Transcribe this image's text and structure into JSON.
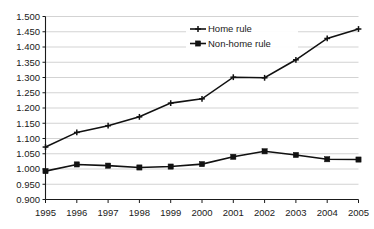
{
  "chart_data": {
    "type": "line",
    "title": "",
    "subtitle": "",
    "xlabel": "",
    "ylabel": "",
    "categories": [
      "1995",
      "1996",
      "1997",
      "1998",
      "1999",
      "2000",
      "2001",
      "2002",
      "2003",
      "2004",
      "2005"
    ],
    "x": [
      1995,
      1996,
      1997,
      1998,
      1999,
      2000,
      2001,
      2002,
      2003,
      2004,
      2005
    ],
    "series": [
      {
        "name": "Home rule",
        "marker": "cross",
        "color": "#111111",
        "values": [
          1.072,
          1.12,
          1.142,
          1.171,
          1.216,
          1.23,
          1.301,
          1.299,
          1.358,
          1.428,
          1.459
        ]
      },
      {
        "name": "Non-home rule",
        "marker": "square",
        "color": "#111111",
        "values": [
          0.993,
          1.015,
          1.011,
          1.005,
          1.008,
          1.016,
          1.04,
          1.058,
          1.046,
          1.032,
          1.031
        ]
      }
    ],
    "ylim": [
      0.9,
      1.5
    ],
    "ytick_step": 0.05,
    "ytick_labels": [
      "1.500",
      "1.450",
      "1.400",
      "1.350",
      "1.300",
      "1.250",
      "1.200",
      "1.150",
      "1.100",
      "1.050",
      "1.000",
      "0.950",
      "0.900"
    ],
    "ytick_values": [
      1.5,
      1.45,
      1.4,
      1.35,
      1.3,
      1.25,
      1.2,
      1.15,
      1.1,
      1.05,
      1.0,
      0.95,
      0.9
    ],
    "grid": "horizontal",
    "legend_position": "inside-top-center-right",
    "legend_entries": [
      "Home rule",
      "Non-home rule"
    ],
    "colors": {
      "background": "#ffffff",
      "gridline": "#c8c8c8",
      "axis": "#1a1a1a",
      "series": "#111111",
      "text": "#1a1a1a"
    }
  }
}
